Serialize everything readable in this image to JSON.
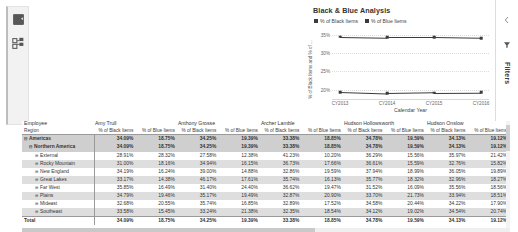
{
  "left_rail": {
    "items": [
      {
        "icon": "report-page-icon",
        "name": "report-view"
      },
      {
        "icon": "model-relationships-icon",
        "name": "model-view"
      }
    ]
  },
  "filters_pane": {
    "label": "Filters",
    "collapse_icon": "chevron-left-icon",
    "funnel_icon": "filter-funnel-icon"
  },
  "chart_data": {
    "type": "line",
    "title": "Black & Blue Analysis",
    "xlabel": "Calendar Year",
    "ylabel": "% of Black Items and % of ...",
    "x": [
      "CY2013",
      "CY2014",
      "CY2015",
      "CY2016"
    ],
    "series": [
      {
        "name": "% of Black Items",
        "values": [
          34.4,
          34.2,
          34.2,
          34.0
        ],
        "color": "#3b3b3b"
      },
      {
        "name": "% of Blue Items",
        "values": [
          19.4,
          19.0,
          19.2,
          19.3
        ],
        "color": "#3b3b3b"
      }
    ],
    "yticks": [
      "35%",
      "30%",
      "25%",
      "20%"
    ],
    "ylim": [
      17.5,
      36.5
    ],
    "grid": true,
    "legend_position": "top-left"
  },
  "table": {
    "row_header_top": "Employee",
    "row_header_bottom": "Region",
    "employees": [
      "Amy Trull",
      "Anthony Grosse",
      "Archer Lamble",
      "Hudson Hollowsworth",
      "Hudson Onslow"
    ],
    "measures": [
      "% of Black Items",
      "% of Blue Items"
    ],
    "rows": [
      {
        "label": "Americas",
        "level": 0,
        "expander": "⊟",
        "values": [
          "34.09%",
          "18.75%",
          "34.25%",
          "19.39%",
          "33.38%",
          "18.85%",
          "34.78%",
          "19.59%",
          "34.13%",
          "19.12%"
        ]
      },
      {
        "label": "Northern America",
        "level": 1,
        "expander": "⊟",
        "values": [
          "34.09%",
          "18.75%",
          "34.25%",
          "19.39%",
          "33.38%",
          "18.85%",
          "34.78%",
          "19.59%",
          "34.13%",
          "19.12%"
        ]
      },
      {
        "label": "External",
        "level": 2,
        "expander": "⊞",
        "values": [
          "28.91%",
          "28.32%",
          "27.58%",
          "12.38%",
          "41.23%",
          "10.20%",
          "36.29%",
          "15.56%",
          "35.97%",
          "21.42%"
        ]
      },
      {
        "label": "Rocky Mountain",
        "level": 2,
        "expander": "⊞",
        "values": [
          "31.00%",
          "18.16%",
          "34.94%",
          "16.15%",
          "36.73%",
          "17.66%",
          "36.61%",
          "15.59%",
          "32.76%",
          "15.82%"
        ]
      },
      {
        "label": "New England",
        "level": 2,
        "expander": "⊞",
        "values": [
          "34.19%",
          "16.24%",
          "39.00%",
          "14.88%",
          "32.86%",
          "19.59%",
          "37.94%",
          "18.99%",
          "36.05%",
          "19.89%"
        ]
      },
      {
        "label": "Great Lakes",
        "level": 2,
        "expander": "⊞",
        "values": [
          "33.17%",
          "14.38%",
          "46.17%",
          "17.61%",
          "35.74%",
          "16.13%",
          "35.77%",
          "18.32%",
          "32.96%",
          "18.27%"
        ]
      },
      {
        "label": "Far West",
        "level": 2,
        "expander": "⊞",
        "values": [
          "35.85%",
          "16.49%",
          "31.40%",
          "24.40%",
          "36.62%",
          "19.47%",
          "31.52%",
          "16.09%",
          "35.56%",
          "18.56%"
        ]
      },
      {
        "label": "Plains",
        "level": 2,
        "expander": "⊞",
        "values": [
          "34.79%",
          "19.46%",
          "35.17%",
          "19.49%",
          "32.87%",
          "20.90%",
          "33.70%",
          "21.73%",
          "33.94%",
          "18.51%"
        ]
      },
      {
        "label": "Mideast",
        "level": 2,
        "expander": "⊞",
        "values": [
          "32.68%",
          "20.55%",
          "35.74%",
          "16.85%",
          "32.89%",
          "17.52%",
          "34.58%",
          "20.44%",
          "34.22%",
          "17.90%"
        ]
      },
      {
        "label": "Southeast",
        "level": 2,
        "expander": "⊞",
        "values": [
          "33.58%",
          "15.45%",
          "33.24%",
          "21.38%",
          "32.35%",
          "18.54%",
          "34.12%",
          "19.02%",
          "34.54%",
          "20.74%"
        ]
      },
      {
        "label": "Total",
        "level": 0,
        "expander": "",
        "values": [
          "34.09%",
          "18.75%",
          "34.25%",
          "19.39%",
          "33.38%",
          "18.85%",
          "34.78%",
          "19.59%",
          "34.13%",
          "19.12%"
        ]
      }
    ]
  }
}
